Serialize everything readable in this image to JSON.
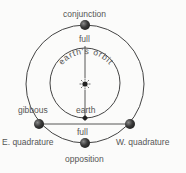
{
  "diagram": {
    "labels": {
      "conjunction": "conjunction",
      "full_top": "full",
      "earths_orbit": "earth's orbit",
      "gibbous": "gibbous",
      "earth": "earth",
      "full_bottom": "full",
      "e_quadrature": "E. quadrature",
      "w_quadrature": "W. quadrature",
      "opposition": "opposition"
    },
    "colors": {
      "line": "#444444",
      "planet": "#3a3a3a",
      "planet_highlight": "#7a7a7a",
      "text": "#555555",
      "background": "#fbfbfa"
    }
  }
}
